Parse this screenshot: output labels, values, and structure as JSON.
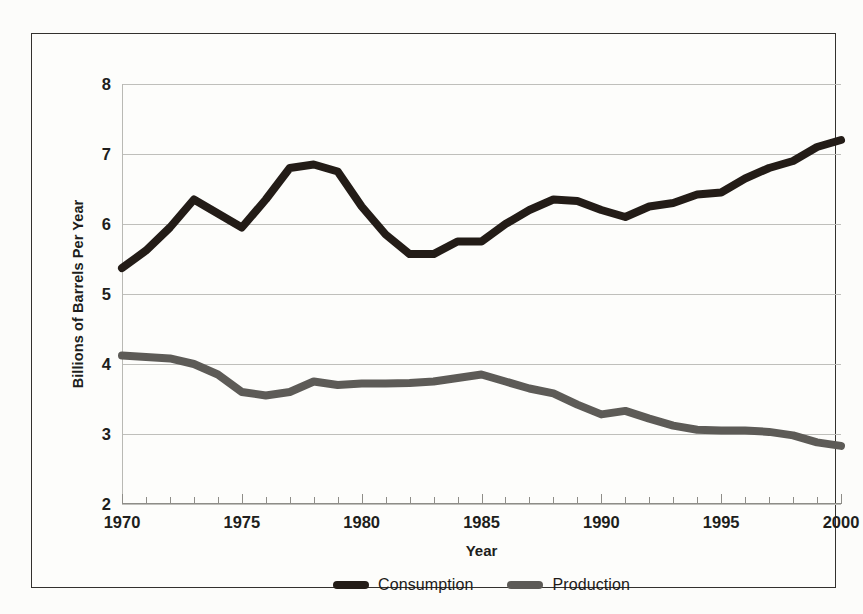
{
  "chart_data": {
    "type": "line",
    "title": "",
    "xlabel": "Year",
    "ylabel": "Billions of Barrels Per Year",
    "xlim": [
      1970,
      2000
    ],
    "ylim": [
      2,
      8
    ],
    "grid": true,
    "legend_position": "bottom",
    "y_ticks": [
      8,
      7,
      6,
      5,
      4,
      3,
      2
    ],
    "y_tick_labels": [
      "8",
      "7",
      "6",
      "5",
      "4",
      "3",
      "2"
    ],
    "x_ticks": [
      1970,
      1975,
      1980,
      1985,
      1990,
      1995,
      2000
    ],
    "x_tick_labels": [
      "1970",
      "1975",
      "1980",
      "1985",
      "1990",
      "1995",
      "2000"
    ],
    "x_minor_tick_interval": 1,
    "x": [
      1970,
      1971,
      1972,
      1973,
      1974,
      1975,
      1976,
      1977,
      1978,
      1979,
      1980,
      1981,
      1982,
      1983,
      1984,
      1985,
      1986,
      1987,
      1988,
      1989,
      1990,
      1991,
      1992,
      1993,
      1994,
      1995,
      1996,
      1997,
      1998,
      1999,
      2000
    ],
    "series": [
      {
        "name": "Consumption",
        "color": "#231c17",
        "values": [
          5.37,
          5.62,
          5.95,
          6.35,
          6.15,
          5.95,
          6.35,
          6.8,
          6.85,
          6.75,
          6.25,
          5.85,
          5.57,
          5.57,
          5.75,
          5.75,
          6.0,
          6.2,
          6.35,
          6.33,
          6.2,
          6.1,
          6.25,
          6.3,
          6.42,
          6.45,
          6.65,
          6.8,
          6.9,
          7.1,
          7.2
        ]
      },
      {
        "name": "Production",
        "color": "#5d5b57",
        "values": [
          4.12,
          4.1,
          4.08,
          4.0,
          3.85,
          3.6,
          3.55,
          3.6,
          3.75,
          3.7,
          3.72,
          3.72,
          3.73,
          3.75,
          3.8,
          3.85,
          3.75,
          3.65,
          3.58,
          3.42,
          3.28,
          3.33,
          3.22,
          3.12,
          3.06,
          3.05,
          3.05,
          3.03,
          2.98,
          2.88,
          2.83
        ]
      }
    ]
  },
  "legend": {
    "items": [
      {
        "label": "Consumption",
        "color": "#231c17"
      },
      {
        "label": "Production",
        "color": "#5d5b57"
      }
    ]
  }
}
